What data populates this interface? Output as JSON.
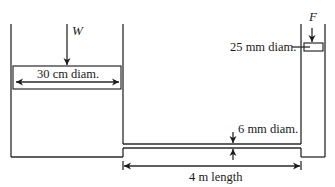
{
  "diagram": {
    "type": "hydraulic-press-schematic",
    "labels": {
      "large_piston_force": "W",
      "small_piston_force": "F",
      "large_piston_diameter": "30 cm diam.",
      "small_piston_diameter": "25 mm diam.",
      "pipe_diameter": "6 mm diam.",
      "pipe_length": "4 m length"
    },
    "colors": {
      "line": "#2a2a2a",
      "background": "#ffffff"
    }
  }
}
